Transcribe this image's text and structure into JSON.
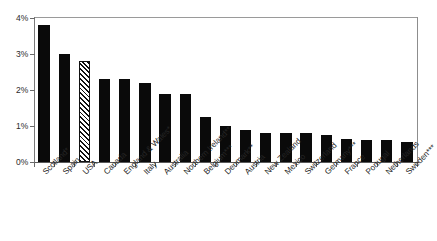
{
  "chart_data": {
    "type": "bar",
    "title": "",
    "xlabel": "",
    "ylabel": "",
    "ylim": [
      0,
      4
    ],
    "ytick_labels": [
      "0%",
      "1%",
      "2%",
      "3%",
      "4%"
    ],
    "ytick_values": [
      0,
      1,
      2,
      3,
      4
    ],
    "grid": false,
    "legend": null,
    "highlight_category": "USA",
    "highlight_style": "diagonal-hatch",
    "bar_color": "#0a0a0a",
    "categories": [
      "Scotland*",
      "Spain",
      "USA",
      "Canada",
      "England & Wales*",
      "Italy",
      "Australia",
      "Northern Ireland**",
      "Belgium***",
      "Denmark**",
      "Austria",
      "New Zealand",
      "Mexico",
      "Switzerland",
      "Germany***",
      "France",
      "Portugal",
      "Netherlands",
      "Sweden***"
    ],
    "values": [
      3.8,
      3.0,
      2.8,
      2.3,
      2.3,
      2.2,
      1.9,
      1.9,
      1.25,
      1.0,
      0.9,
      0.8,
      0.8,
      0.8,
      0.75,
      0.65,
      0.62,
      0.6,
      0.55
    ]
  }
}
